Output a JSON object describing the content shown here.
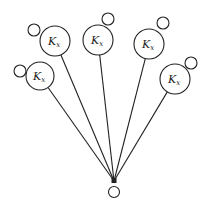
{
  "diagram": {
    "type": "star-graph",
    "stroke_color": "#222222",
    "background": "#ffffff",
    "hub": {
      "x": 114,
      "y": 181,
      "label": ""
    },
    "root_loop": {
      "cx": 114,
      "cy": 192,
      "r": 5.5
    },
    "nodes": [
      {
        "id": "n1",
        "label_main": "K",
        "label_sub": "x",
        "cx": 55,
        "cy": 41,
        "r": 15,
        "loop": {
          "cx": 34,
          "cy": 30,
          "r": 6
        }
      },
      {
        "id": "n2",
        "label_main": "K",
        "label_sub": "x",
        "cx": 98,
        "cy": 40,
        "r": 15,
        "loop": {
          "cx": 108,
          "cy": 19,
          "r": 6
        }
      },
      {
        "id": "n3",
        "label_main": "K",
        "label_sub": "x",
        "cx": 149,
        "cy": 44,
        "r": 15,
        "loop": {
          "cx": 163,
          "cy": 23,
          "r": 6
        }
      },
      {
        "id": "n4",
        "label_main": "K",
        "label_sub": "x",
        "cx": 40,
        "cy": 76,
        "r": 14,
        "loop": {
          "cx": 20,
          "cy": 71,
          "r": 6
        }
      },
      {
        "id": "n5",
        "label_main": "K",
        "label_sub": "x",
        "cx": 175,
        "cy": 79,
        "r": 15,
        "loop": {
          "cx": 191,
          "cy": 63,
          "r": 6
        }
      }
    ]
  }
}
